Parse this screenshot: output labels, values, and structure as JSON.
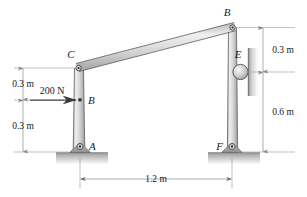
{
  "figure": {
    "background": "#ffffff",
    "members": {
      "left_column_label": "left-column-AC",
      "right_column_label": "right-column-FB",
      "inclined_beam_label": "inclined-beam-CB",
      "fill_light": "#e8e8e8",
      "fill_mid": "#c6c6c6",
      "edge": "#5d5d5d"
    },
    "joints": [
      {
        "id": "B_top",
        "label": "B",
        "x": 232,
        "y": 27
      },
      {
        "id": "C",
        "label": "C",
        "x": 78,
        "y": 68
      },
      {
        "id": "E",
        "label": "E",
        "x": 240,
        "y": 72
      },
      {
        "id": "B_mid",
        "label": "B",
        "x": 80,
        "y": 100
      },
      {
        "id": "A",
        "label": "A",
        "x": 80,
        "y": 152
      },
      {
        "id": "F",
        "label": "F",
        "x": 232,
        "y": 152
      }
    ],
    "load": {
      "name": "applied-force",
      "magnitude": "200 N",
      "direction": "right"
    },
    "dimensions": [
      {
        "id": "left-upper",
        "value": "0.3 m",
        "orientation": "vertical"
      },
      {
        "id": "left-lower",
        "value": "0.3 m",
        "orientation": "vertical"
      },
      {
        "id": "right-upper",
        "value": "0.3 m",
        "orientation": "vertical"
      },
      {
        "id": "right-lower",
        "value": "0.6 m",
        "orientation": "vertical"
      },
      {
        "id": "span",
        "value": "1.2 m",
        "orientation": "horizontal"
      }
    ],
    "supports": {
      "pin_a": "pin-support-A",
      "pin_f": "pin-support-F",
      "roller_e": "roller-E",
      "wall_e": "wall-surface-E",
      "ground": "ground-hatch"
    }
  }
}
